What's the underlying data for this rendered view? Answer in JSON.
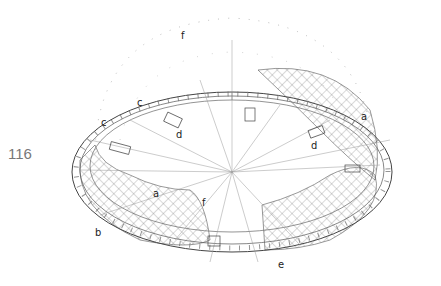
{
  "page_number": "116",
  "labels": [
    {
      "id": "f-top",
      "text": "f",
      "x": 181,
      "y": 30
    },
    {
      "id": "c-upper",
      "text": "c",
      "x": 137,
      "y": 97
    },
    {
      "id": "c-left",
      "text": "c",
      "x": 101,
      "y": 117
    },
    {
      "id": "d-left",
      "text": "d",
      "x": 176,
      "y": 129
    },
    {
      "id": "a-right",
      "text": "a",
      "x": 361,
      "y": 111
    },
    {
      "id": "d-right",
      "text": "d",
      "x": 311,
      "y": 140
    },
    {
      "id": "a-inner",
      "text": "a",
      "x": 153,
      "y": 188
    },
    {
      "id": "f-inner",
      "text": "f",
      "x": 202,
      "y": 197
    },
    {
      "id": "b-left",
      "text": "b",
      "x": 95,
      "y": 227
    },
    {
      "id": "e-bottom",
      "text": "e",
      "x": 278,
      "y": 259
    }
  ]
}
